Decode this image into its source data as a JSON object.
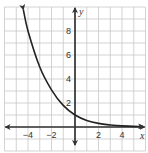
{
  "chart_data": {
    "type": "line",
    "title": "",
    "xlabel": "x",
    "ylabel": "y",
    "xlim": [
      -6,
      6
    ],
    "ylim": [
      -2,
      10
    ],
    "grid": true,
    "x_ticks": [
      -4,
      -2,
      2,
      4
    ],
    "x_tick_labels": [
      "−4",
      "−2",
      "2",
      "4"
    ],
    "y_ticks": [
      2,
      4,
      6,
      8
    ],
    "y_tick_labels": [
      "2",
      "4",
      "6",
      "8"
    ],
    "series": [
      {
        "name": "exponential decay curve",
        "description": "decreasing exponential, y-intercept 1, approaching y = 0 as x increases",
        "x": [
          -4.4,
          -4,
          -3,
          -2,
          -1,
          0,
          1,
          2,
          3,
          4,
          5.8
        ],
        "y": [
          9.8,
          8.0,
          5.0,
          3.1,
          1.8,
          1.0,
          0.55,
          0.3,
          0.17,
          0.09,
          0.03
        ],
        "arrows_at_ends": true,
        "color": "#222222"
      }
    ]
  },
  "colors": {
    "grid": "#c8c8c8",
    "axis": "#333333",
    "curve": "#222222"
  }
}
